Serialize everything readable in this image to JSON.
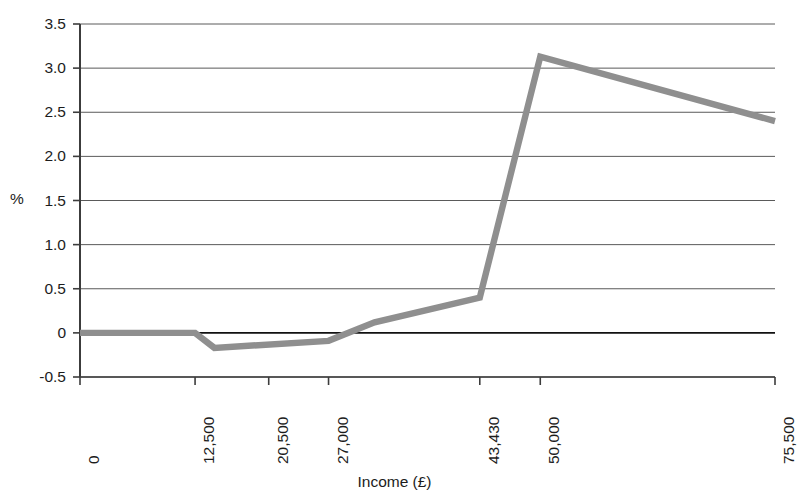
{
  "chart_data": {
    "type": "line",
    "title": "",
    "xlabel": "Income (£)",
    "ylabel": "%",
    "x": [
      0,
      6000,
      12500,
      14600,
      27000,
      32000,
      43430,
      50000,
      75500
    ],
    "values": [
      0,
      0,
      0,
      -0.17,
      -0.09,
      0.12,
      0.4,
      3.13,
      2.4
    ],
    "series": [
      {
        "name": "Effective rate change",
        "color": "#8f8f8f",
        "x": [
          0,
          6000,
          12500,
          14600,
          27000,
          32000,
          43430,
          50000,
          75500
        ],
        "values": [
          0,
          0,
          0,
          -0.17,
          -0.09,
          0.12,
          0.4,
          3.13,
          2.4
        ]
      }
    ],
    "xlim": [
      0,
      75500
    ],
    "ylim": [
      -0.5,
      3.5
    ],
    "ytick_labels": [
      "3.5",
      "3.0",
      "2.5",
      "2.0",
      "1.5",
      "1.0",
      "0.5",
      "0",
      "-0.5"
    ],
    "ytick_values": [
      3.5,
      3.0,
      2.5,
      2.0,
      1.5,
      1.0,
      0.5,
      0,
      -0.5
    ],
    "xtick_labels": [
      "0",
      "12,500",
      "20,500",
      "27,000",
      "43,430",
      "50,000",
      "75,500"
    ],
    "xtick_values": [
      0,
      12500,
      20500,
      27000,
      43430,
      50000,
      75500
    ],
    "grid": "horizontal",
    "legend": "none",
    "zero_line_emphasis": true,
    "axis_color": "#3c3c3c",
    "grid_color": "#5a5a5a"
  }
}
